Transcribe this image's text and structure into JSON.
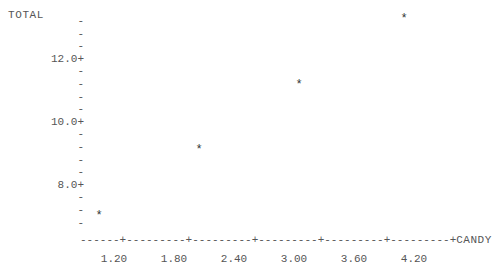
{
  "chart_data": {
    "type": "scatter",
    "title": "",
    "xlabel": "CANDY",
    "ylabel": "TOTAL",
    "style": "character-plot",
    "marker": "*",
    "grid": false,
    "legend": null,
    "xlim": [
      0.78,
      4.5
    ],
    "ylim": [
      6.8,
      13.6
    ],
    "xticks": [
      "1.20",
      "1.80",
      "2.40",
      "3.00",
      "3.60",
      "4.20"
    ],
    "xtick_values": [
      1.2,
      1.8,
      2.4,
      3.0,
      3.6,
      4.2
    ],
    "yticks": [
      "12.0+",
      "10.0+",
      "8.0+"
    ],
    "ytick_values": [
      12.0,
      10.0,
      8.0
    ],
    "x": [
      1.05,
      2.05,
      3.05,
      4.1
    ],
    "y": [
      7.05,
      9.15,
      11.2,
      13.3
    ],
    "points": [
      {
        "x": 1.05,
        "y": 7.05,
        "marker": "*"
      },
      {
        "x": 2.05,
        "y": 9.15,
        "marker": "*"
      },
      {
        "x": 3.05,
        "y": 11.2,
        "marker": "*"
      },
      {
        "x": 4.1,
        "y": 13.3,
        "marker": "*"
      }
    ]
  },
  "axes": {
    "y_variable_label": "TOTAL",
    "x_variable_label": "CANDY",
    "y_rows": [
      {
        "label": "",
        "tick": "-"
      },
      {
        "label": "",
        "tick": "-"
      },
      {
        "label": "",
        "tick": "-"
      },
      {
        "label": "12.0",
        "tick": "+"
      },
      {
        "label": "",
        "tick": "-"
      },
      {
        "label": "",
        "tick": "-"
      },
      {
        "label": "",
        "tick": "-"
      },
      {
        "label": "",
        "tick": "-"
      },
      {
        "label": "10.0",
        "tick": "+"
      },
      {
        "label": "",
        "tick": "-"
      },
      {
        "label": "",
        "tick": "-"
      },
      {
        "label": "",
        "tick": "-"
      },
      {
        "label": "",
        "tick": "-"
      },
      {
        "label": "8.0",
        "tick": "+"
      },
      {
        "label": "",
        "tick": "-"
      },
      {
        "label": "",
        "tick": "-"
      },
      {
        "label": "",
        "tick": "-"
      }
    ],
    "x_axis_glyphs": "------+---------+---------+---------+---------+---------+",
    "x_axis_terminator": "CANDY",
    "x_tick_labels": [
      "1.20",
      "1.80",
      "2.40",
      "3.00",
      "3.60",
      "4.20"
    ]
  },
  "colors": {
    "background": "#ffffff",
    "text": "#555555",
    "marker": "#333333"
  }
}
